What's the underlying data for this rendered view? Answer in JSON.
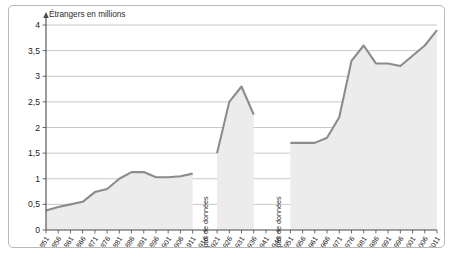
{
  "figure": {
    "background_color": "#ffffff",
    "border_color": "#b9b9b9",
    "area_color": "#ececec",
    "line_color": "#8c8c8c",
    "grid_color": "#b0b0b0",
    "axis_color": "#4a4a4a"
  },
  "chart_data": {
    "type": "area",
    "title": "",
    "xlabel": "",
    "ylabel": "Étrangers en millions",
    "ylim": [
      0,
      4
    ],
    "yticks": [
      "0",
      "0,5",
      "1",
      "1,5",
      "2",
      "2,5",
      "3",
      "3,5",
      "4"
    ],
    "ytick_values": [
      0,
      0.5,
      1,
      1.5,
      2,
      2.5,
      3,
      3.5,
      4
    ],
    "grid": true,
    "legend": "none",
    "categories": [
      "1851",
      "1856",
      "1861",
      "1866",
      "1871",
      "1876",
      "1881",
      "1886",
      "1891",
      "1896",
      "1901",
      "1906",
      "1911",
      "1916",
      "1921",
      "1926",
      "1931",
      "1936",
      "1941",
      "1946",
      "1951",
      "1956",
      "1961",
      "1966",
      "1971",
      "1976",
      "1981",
      "1986",
      "1991",
      "1996",
      "2001",
      "2006",
      "2011"
    ],
    "values": [
      0.38,
      0.45,
      0.5,
      0.55,
      0.74,
      0.8,
      1.0,
      1.13,
      1.13,
      1.03,
      1.03,
      1.05,
      1.1,
      null,
      1.5,
      2.5,
      2.8,
      2.25,
      null,
      null,
      1.7,
      1.7,
      1.7,
      1.8,
      2.2,
      3.3,
      3.6,
      3.25,
      3.25,
      3.2,
      3.4,
      3.6,
      3.9
    ],
    "series": [
      {
        "name": "Étrangers en millions",
        "values": [
          0.38,
          0.45,
          0.5,
          0.55,
          0.74,
          0.8,
          1.0,
          1.13,
          1.13,
          1.03,
          1.03,
          1.05,
          1.1,
          null,
          1.5,
          2.5,
          2.8,
          2.25,
          null,
          null,
          1.7,
          1.7,
          1.7,
          1.8,
          2.2,
          3.3,
          3.6,
          3.25,
          3.25,
          3.2,
          3.4,
          3.6,
          3.9
        ]
      }
    ],
    "annotations": [
      {
        "text": "pas de données",
        "at_category": "1916",
        "orientation": "vertical"
      },
      {
        "text": "pas de données",
        "at_category": "1946",
        "orientation": "vertical"
      }
    ]
  }
}
